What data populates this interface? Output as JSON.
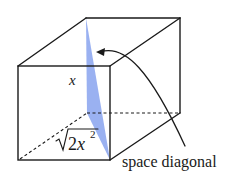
{
  "diagram": {
    "type": "3d-cube",
    "labels": {
      "edge_label": "x",
      "base_diagonal_radicand": "2x",
      "base_diagonal_exponent": "2",
      "callout": "space diagonal"
    },
    "colors": {
      "edge": "#1a1a1a",
      "diagonal_plane": "#8fa8f0"
    }
  }
}
